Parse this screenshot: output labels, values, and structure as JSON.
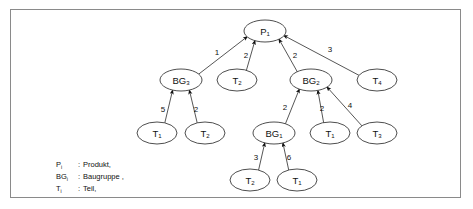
{
  "figure": {
    "nodes": [
      {
        "id": "P1",
        "base": "P",
        "sub": "1",
        "cx": 265,
        "cy": 31,
        "rx": 21,
        "ry": 11
      },
      {
        "id": "BG3",
        "base": "BG",
        "sub": "3",
        "cx": 181,
        "cy": 80,
        "rx": 21,
        "ry": 11
      },
      {
        "id": "T2a",
        "base": "T",
        "sub": "2",
        "cx": 237,
        "cy": 80,
        "rx": 20,
        "ry": 11
      },
      {
        "id": "BG2",
        "base": "BG",
        "sub": "2",
        "cx": 311,
        "cy": 80,
        "rx": 21,
        "ry": 11
      },
      {
        "id": "T4",
        "base": "T",
        "sub": "4",
        "cx": 377,
        "cy": 80,
        "rx": 20,
        "ry": 11
      },
      {
        "id": "T1a",
        "base": "T",
        "sub": "1",
        "cx": 157,
        "cy": 133,
        "rx": 20,
        "ry": 11
      },
      {
        "id": "T2b",
        "base": "T",
        "sub": "2",
        "cx": 205,
        "cy": 133,
        "rx": 20,
        "ry": 11
      },
      {
        "id": "BG1",
        "base": "BG",
        "sub": "1",
        "cx": 274,
        "cy": 133,
        "rx": 21,
        "ry": 11
      },
      {
        "id": "T1b",
        "base": "T",
        "sub": "1",
        "cx": 330,
        "cy": 133,
        "rx": 20,
        "ry": 11
      },
      {
        "id": "T3",
        "base": "T",
        "sub": "3",
        "cx": 377,
        "cy": 133,
        "rx": 20,
        "ry": 11
      },
      {
        "id": "T2c",
        "base": "T",
        "sub": "2",
        "cx": 250,
        "cy": 180,
        "rx": 20,
        "ry": 11
      },
      {
        "id": "T1c",
        "base": "T",
        "sub": "1",
        "cx": 297,
        "cy": 180,
        "rx": 20,
        "ry": 11
      }
    ],
    "edges": [
      {
        "from": "BG3",
        "to": "P1",
        "weight": "1",
        "lx": 217,
        "ly": 55
      },
      {
        "from": "T2a",
        "to": "P1",
        "weight": "2",
        "lx": 246,
        "ly": 58
      },
      {
        "from": "BG2",
        "to": "P1",
        "weight": "2",
        "lx": 295,
        "ly": 58
      },
      {
        "from": "T4",
        "to": "P1",
        "weight": "3",
        "lx": 330,
        "ly": 52
      },
      {
        "from": "T1a",
        "to": "BG3",
        "weight": "5",
        "lx": 163,
        "ly": 112
      },
      {
        "from": "T2b",
        "to": "BG3",
        "weight": "2",
        "lx": 196,
        "ly": 112
      },
      {
        "from": "BG1",
        "to": "BG2",
        "weight": "2",
        "lx": 285,
        "ly": 110
      },
      {
        "from": "T1b",
        "to": "BG2",
        "weight": "2",
        "lx": 322,
        "ly": 111
      },
      {
        "from": "T3",
        "to": "BG2",
        "weight": "4",
        "lx": 350,
        "ly": 108
      },
      {
        "from": "T2c",
        "to": "BG1",
        "weight": "3",
        "lx": 256,
        "ly": 160
      },
      {
        "from": "T1c",
        "to": "BG1",
        "weight": "6",
        "lx": 289,
        "ly": 160
      }
    ],
    "legend": [
      {
        "symbol": "P",
        "sub": "i",
        "separator": ":",
        "definition": "Produkt,"
      },
      {
        "symbol": "BG",
        "sub": "i",
        "separator": ":",
        "definition": "Baugruppe ,"
      },
      {
        "symbol": "T",
        "sub": "i",
        "separator": ":",
        "definition": "Teil,"
      }
    ],
    "legend_origin": {
      "x": 56,
      "y": 167,
      "line_height": 12
    },
    "colors": {
      "border": "#8a8a8a",
      "node_stroke": "#3a3a3a",
      "edge_stroke": "#2b2b2b",
      "text": "#111111",
      "background": "#ffffff"
    }
  }
}
